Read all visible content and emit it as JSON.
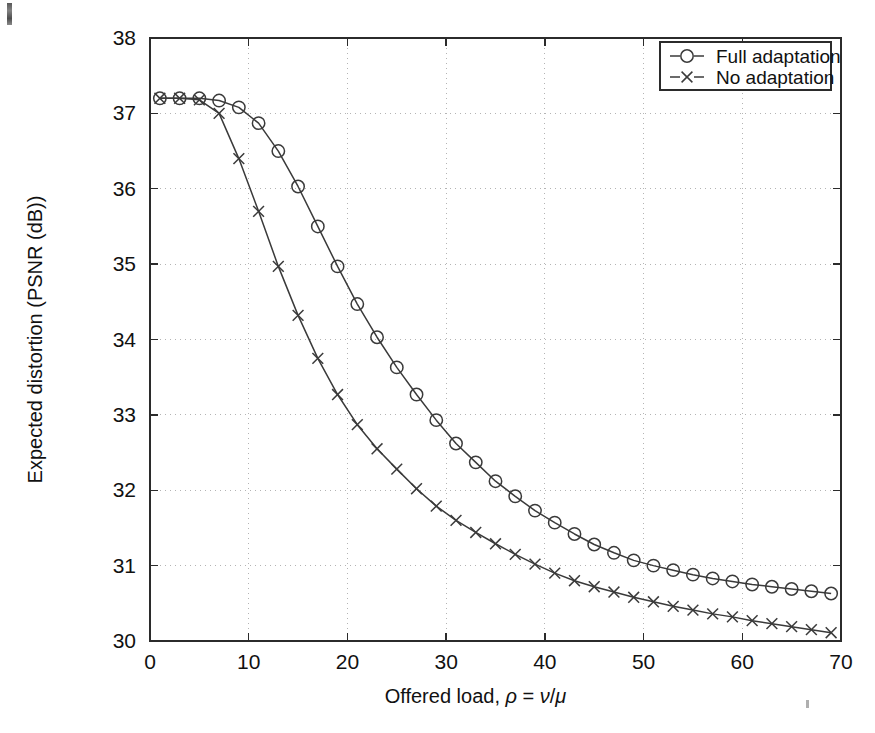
{
  "chart_data": {
    "type": "line",
    "title": "",
    "xlabel": "Offered load, ρ = ν/μ",
    "ylabel": "Expected distortion (PSNR (dB))",
    "xlim": [
      0,
      70
    ],
    "ylim": [
      30,
      38
    ],
    "xticks": [
      0,
      10,
      20,
      30,
      40,
      50,
      60,
      70
    ],
    "yticks": [
      30,
      31,
      32,
      33,
      34,
      35,
      36,
      37,
      38
    ],
    "xtick_labels": [
      "0",
      "10",
      "20",
      "30",
      "40",
      "50",
      "60",
      "70"
    ],
    "ytick_labels": [
      "30",
      "31",
      "32",
      "33",
      "34",
      "35",
      "36",
      "37",
      "38"
    ],
    "grid": true,
    "grid_style": "dotted",
    "grid_color": "#b4b4b4",
    "legend_position": "top-right",
    "line_color": "#3a3a3a",
    "x": [
      1,
      3,
      5,
      7,
      9,
      11,
      13,
      15,
      17,
      19,
      21,
      23,
      25,
      27,
      29,
      31,
      33,
      35,
      37,
      39,
      41,
      43,
      45,
      47,
      49,
      51,
      53,
      55,
      57,
      59,
      61,
      63,
      65,
      67,
      69
    ],
    "series": [
      {
        "name": "Full adaptation",
        "marker": "circle",
        "values": [
          37.2,
          37.2,
          37.2,
          37.17,
          37.08,
          36.87,
          36.5,
          36.03,
          35.5,
          34.97,
          34.47,
          34.03,
          33.63,
          33.27,
          32.93,
          32.62,
          32.37,
          32.12,
          31.92,
          31.73,
          31.57,
          31.42,
          31.28,
          31.17,
          31.07,
          31.0,
          30.94,
          30.88,
          30.83,
          30.79,
          30.75,
          30.72,
          30.69,
          30.66,
          30.63
        ]
      },
      {
        "name": "No adaptation",
        "marker": "cross",
        "values": [
          37.2,
          37.2,
          37.18,
          37.0,
          36.4,
          35.7,
          34.97,
          34.32,
          33.75,
          33.27,
          32.87,
          32.55,
          32.28,
          32.02,
          31.79,
          31.6,
          31.44,
          31.29,
          31.15,
          31.02,
          30.9,
          30.8,
          30.72,
          30.65,
          30.58,
          30.52,
          30.46,
          30.41,
          30.36,
          30.32,
          30.27,
          30.23,
          30.19,
          30.15,
          30.11
        ]
      }
    ]
  },
  "legend": {
    "items": [
      {
        "label": "Full adaptation",
        "marker": "circle"
      },
      {
        "label": "No adaptation",
        "marker": "cross"
      }
    ]
  },
  "axis": {
    "x_title_prefix": "Offered load, ",
    "x_title_rho": "ρ",
    "x_title_eq": " = ",
    "x_title_nu": "ν",
    "x_title_slash": "/",
    "x_title_mu": "μ",
    "y_title": "Expected distortion (PSNR (dB))"
  }
}
